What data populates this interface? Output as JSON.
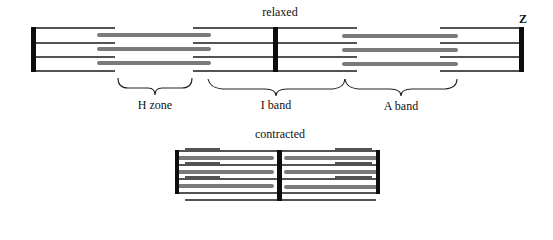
{
  "title_relaxed": "relaxed",
  "title_contracted": "contracted",
  "z_label": "Z",
  "regions": [
    {
      "label": "H zone"
    },
    {
      "label": "I band"
    },
    {
      "label": "A band"
    }
  ],
  "colors": {
    "thin_filament": "#1a1a1a",
    "thick_filament": "#7a7a7a",
    "z_line": "#0d0d0d",
    "background": "#ffffff"
  }
}
